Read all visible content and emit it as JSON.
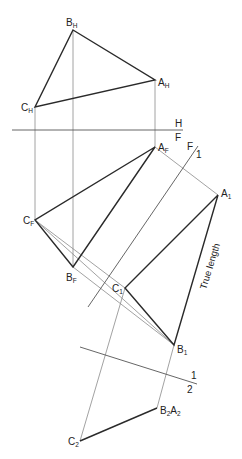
{
  "diagram": {
    "type": "descriptive-geometry-auxiliary-views",
    "points": {
      "BH": {
        "label": "B",
        "sub": "H",
        "x": 73,
        "y": 30
      },
      "AH": {
        "label": "A",
        "sub": "H",
        "x": 155,
        "y": 80
      },
      "CH": {
        "label": "C",
        "sub": "H",
        "x": 35,
        "y": 107
      },
      "AF": {
        "label": "A",
        "sub": "F",
        "x": 155,
        "y": 147
      },
      "CF": {
        "label": "C",
        "sub": "F",
        "x": 35,
        "y": 220
      },
      "BF": {
        "label": "B",
        "sub": "F",
        "x": 73,
        "y": 267
      },
      "A1": {
        "label": "A",
        "sub": "1",
        "x": 218,
        "y": 195
      },
      "C1": {
        "label": "C",
        "sub": "1",
        "x": 125,
        "y": 288
      },
      "B1": {
        "label": "B",
        "sub": "1",
        "x": 174,
        "y": 345
      },
      "B2A2": {
        "label1": "B",
        "sub1": "2",
        "label2": "A",
        "sub2": "2",
        "x": 157,
        "y": 408
      },
      "C2": {
        "label": "C",
        "sub": "2",
        "x": 80,
        "y": 441
      }
    },
    "fold_lines": {
      "HF": {
        "top": "H",
        "bottom": "F"
      },
      "F1": {
        "left": "F",
        "right": "1"
      },
      "12": {
        "top": "1",
        "bottom": "2"
      }
    },
    "annotation": "True length"
  }
}
